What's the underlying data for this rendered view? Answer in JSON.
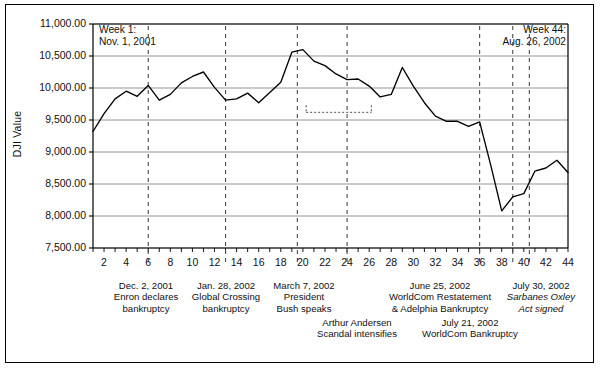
{
  "figure": {
    "border": true,
    "background": "#ffffff"
  },
  "notes": {
    "start": {
      "line1": "Week 1:",
      "line2": "Nov. 1, 2001"
    },
    "end": {
      "line1": "Week 44:",
      "line2": "Aug. 26, 2002"
    }
  },
  "chart_data": {
    "type": "line",
    "title": "",
    "subtitle": "",
    "xlabel": "",
    "ylabel": "DJI Value",
    "grid": true,
    "legend": "none",
    "xlim": [
      1,
      44
    ],
    "ylim": [
      7500,
      11000
    ],
    "ytick_labels": [
      "11,000.00",
      "10,500.00",
      "10,000.00",
      "9,500.00",
      "9,000.00",
      "8,500.00",
      "8,000.00",
      "7,500.00"
    ],
    "ytick_values": [
      11000,
      10500,
      10000,
      9500,
      9000,
      8500,
      8000,
      7500
    ],
    "xtick_labels": [
      "2",
      "4",
      "6",
      "8",
      "10",
      "12",
      "14",
      "16",
      "18",
      "20",
      "22",
      "24",
      "26",
      "28",
      "30",
      "32",
      "34",
      "36",
      "38",
      "40",
      "42",
      "44"
    ],
    "xtick_values": [
      2,
      4,
      6,
      8,
      10,
      12,
      14,
      16,
      18,
      20,
      22,
      24,
      26,
      28,
      30,
      32,
      34,
      36,
      38,
      40,
      42,
      44
    ],
    "minor_ticks": true,
    "series": [
      {
        "name": "DJI Value",
        "color": "#000000",
        "x": [
          1,
          2,
          3,
          4,
          5,
          6,
          7,
          8,
          9,
          10,
          11,
          12,
          13,
          14,
          15,
          16,
          17,
          18,
          19,
          20,
          21,
          22,
          23,
          24,
          25,
          26,
          27,
          28,
          29,
          30,
          31,
          32,
          33,
          34,
          35,
          36,
          37,
          38,
          39,
          40,
          41,
          42,
          43,
          44
        ],
        "values": [
          9320,
          9600,
          9830,
          9950,
          9870,
          10040,
          9810,
          9900,
          10080,
          10180,
          10250,
          10010,
          9810,
          9830,
          9920,
          9770,
          9930,
          10090,
          10560,
          10600,
          10420,
          10350,
          10220,
          10130,
          10140,
          10030,
          9860,
          9900,
          10320,
          10030,
          9770,
          9560,
          9480,
          9480,
          9400,
          9470,
          8800,
          8080,
          8300,
          8350,
          8700,
          8750,
          8870,
          8680
        ]
      }
    ],
    "event_lines": [
      {
        "week": 6,
        "label_key": "enron"
      },
      {
        "week": 13,
        "label_key": "global_crossing"
      },
      {
        "week": 19.5,
        "label_key": "bush"
      },
      {
        "week": 24,
        "label_key": "andersen"
      },
      {
        "week": 36,
        "label_key": "worldcom_restate"
      },
      {
        "week": 39,
        "label_key": "worldcom_bankruptcy"
      },
      {
        "week": 40.5,
        "label_key": "sarbanes"
      }
    ],
    "bracket": {
      "x_start": 20.3,
      "x_end": 26.2,
      "y": 9620,
      "drop_x": 24
    }
  },
  "annotations": [
    {
      "id": "enron",
      "date": "Dec. 2, 2001",
      "line2": "Enron declares",
      "line3": "bankruptcy",
      "italic": false
    },
    {
      "id": "global_crossing",
      "date": "Jan. 28, 2002",
      "line2": "Global Crossing",
      "line3": "bankruptcy",
      "italic": false
    },
    {
      "id": "bush",
      "date": "March 7, 2002",
      "line2": "President",
      "line3": "Bush speaks",
      "italic": false
    },
    {
      "id": "andersen",
      "date": "",
      "line2": "Arthur Andersen",
      "line3": "Scandal intensifies",
      "italic": false
    },
    {
      "id": "worldcom_restate",
      "date": "June 25, 2002",
      "line2": "WorldCom Restatement",
      "line3": "& Adelphia Bankruptcy",
      "italic": false
    },
    {
      "id": "worldcom_bankruptcy",
      "date": "July 21, 2002",
      "line2": "WorldCom Bankruptcy",
      "line3": "",
      "italic": false
    },
    {
      "id": "sarbanes",
      "date": "July 30, 2002",
      "line2": "Sarbanes Oxley",
      "line3": "Act signed",
      "italic": true
    }
  ]
}
